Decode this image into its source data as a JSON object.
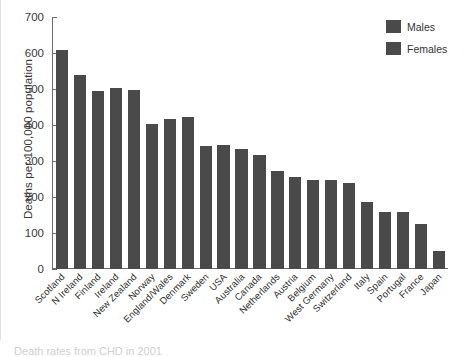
{
  "caption": "Death rates from CHD in 2001",
  "legend": {
    "items": [
      {
        "label": "Males",
        "color": "#4a4a4a",
        "pattern": "solid"
      },
      {
        "label": "Females",
        "color": "#4a4a4a",
        "pattern": "striped"
      }
    ]
  },
  "chart_data": {
    "type": "bar",
    "title": "",
    "subtitle": "",
    "xlabel": "",
    "ylabel": "Deaths per 100,000 population",
    "ylim": [
      0,
      700
    ],
    "yticks": [
      0,
      100,
      200,
      300,
      400,
      500,
      600,
      700
    ],
    "ytick_labels": [
      "0",
      "100",
      "200",
      "300",
      "400",
      "500",
      "600",
      "700"
    ],
    "grid": false,
    "legend_position": "top-right",
    "bar_color": "#4a4a4a",
    "categories": [
      "Scotland",
      "N Ireland",
      "Finland",
      "Ireland",
      "New Zealand",
      "Norway",
      "England/Wales",
      "Denmark",
      "Sweden",
      "USA",
      "Australia",
      "Canada",
      "Netherlands",
      "Austria",
      "Belgium",
      "West Germany",
      "Switzerland",
      "Italy",
      "Spain",
      "Portugal",
      "France",
      "Japan"
    ],
    "series": [
      {
        "name": "Males",
        "values": [
          608,
          538,
          494,
          503,
          496,
          402,
          417,
          422,
          341,
          345,
          333,
          317,
          272,
          256,
          248,
          247,
          238,
          185,
          157,
          158,
          125,
          50
        ]
      }
    ]
  }
}
